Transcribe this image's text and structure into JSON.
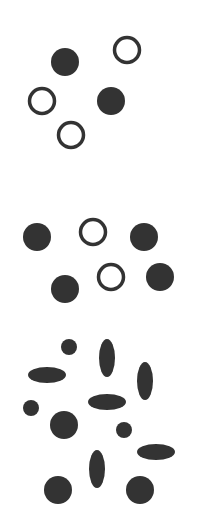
{
  "canvas": {
    "width": 206,
    "height": 506,
    "background": "#ffffff"
  },
  "colors": {
    "ink": "#333333"
  },
  "groups": [
    {
      "name": "group-1",
      "shapes": [
        {
          "type": "filled-circle",
          "cx": 65,
          "cy": 62,
          "r": 14
        },
        {
          "type": "ring",
          "cx": 127,
          "cy": 50,
          "r": 14
        },
        {
          "type": "ring",
          "cx": 42,
          "cy": 101,
          "r": 14
        },
        {
          "type": "filled-circle",
          "cx": 111,
          "cy": 101,
          "r": 14
        },
        {
          "type": "ring",
          "cx": 71,
          "cy": 135,
          "r": 14
        }
      ]
    },
    {
      "name": "group-2",
      "shapes": [
        {
          "type": "filled-circle",
          "cx": 37,
          "cy": 237,
          "r": 14
        },
        {
          "type": "ring",
          "cx": 93,
          "cy": 232,
          "r": 14
        },
        {
          "type": "filled-circle",
          "cx": 144,
          "cy": 237,
          "r": 14
        },
        {
          "type": "filled-circle",
          "cx": 65,
          "cy": 289,
          "r": 14
        },
        {
          "type": "ring",
          "cx": 111,
          "cy": 277,
          "r": 14
        },
        {
          "type": "filled-circle",
          "cx": 160,
          "cy": 277,
          "r": 14
        }
      ]
    },
    {
      "name": "group-3",
      "shapes": [
        {
          "type": "ellipse",
          "cx": 69,
          "cy": 347,
          "rx": 8,
          "ry": 8
        },
        {
          "type": "ellipse",
          "cx": 107,
          "cy": 358,
          "rx": 8,
          "ry": 19
        },
        {
          "type": "ellipse",
          "cx": 47,
          "cy": 375,
          "rx": 19,
          "ry": 8
        },
        {
          "type": "ellipse",
          "cx": 145,
          "cy": 381,
          "rx": 8,
          "ry": 19
        },
        {
          "type": "ellipse",
          "cx": 31,
          "cy": 408,
          "rx": 8,
          "ry": 8
        },
        {
          "type": "ellipse",
          "cx": 107,
          "cy": 402,
          "rx": 19,
          "ry": 8
        },
        {
          "type": "ellipse",
          "cx": 64,
          "cy": 425,
          "rx": 14,
          "ry": 14
        },
        {
          "type": "ellipse",
          "cx": 124,
          "cy": 430,
          "rx": 8,
          "ry": 8
        },
        {
          "type": "ellipse",
          "cx": 156,
          "cy": 452,
          "rx": 19,
          "ry": 8
        },
        {
          "type": "ellipse",
          "cx": 97,
          "cy": 469,
          "rx": 8,
          "ry": 19
        },
        {
          "type": "ellipse",
          "cx": 58,
          "cy": 490,
          "rx": 14,
          "ry": 14
        },
        {
          "type": "ellipse",
          "cx": 140,
          "cy": 490,
          "rx": 14,
          "ry": 14
        }
      ]
    }
  ]
}
